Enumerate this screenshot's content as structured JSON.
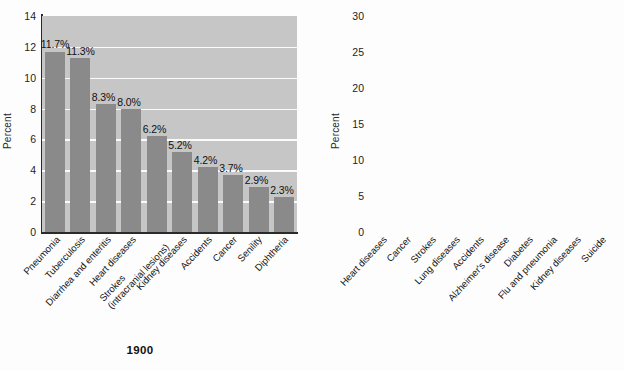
{
  "page": {
    "background": "#fdfdfd",
    "title_remnant": "g"
  },
  "charts": [
    {
      "id": "1900",
      "caption": "1900",
      "ylabel": "Percent",
      "bar_color": "#8a8a8a",
      "plot_background": "#c6c6c6",
      "grid_color": "#fbfbfb",
      "yticks": [
        "14",
        "12",
        "10",
        "8",
        "6",
        "4",
        "2",
        "0"
      ],
      "categories": [
        "Pneumonia",
        "Tuberculosis",
        "Diarrhea and enteritis",
        "Heart diseases",
        "Strokes (intracranial lesions)",
        "Kidney diseases",
        "Accidents",
        "Cancer",
        "Senility",
        "Diphtheria"
      ],
      "category_lines": [
        [
          "Pneumonia"
        ],
        [
          "Tuberculosis"
        ],
        [
          "Diarrhea and enteritis"
        ],
        [
          "Heart diseases"
        ],
        [
          "Strokes",
          "(intracranial lesions)"
        ],
        [
          "Kidney diseases"
        ],
        [
          "Accidents"
        ],
        [
          "Cancer"
        ],
        [
          "Senility"
        ],
        [
          "Diphtheria"
        ]
      ],
      "values": [
        11.7,
        11.3,
        8.3,
        8.0,
        6.2,
        5.2,
        4.2,
        3.7,
        2.9,
        2.3
      ],
      "value_labels": [
        "11.7%",
        "11.3%",
        "8.3%",
        "8.0%",
        "6.2%",
        "5.2%",
        "4.2%",
        "3.7%",
        "2.9%",
        "2.3%"
      ]
    },
    {
      "id": "now",
      "caption": "NOW",
      "ylabel": "Percent",
      "bar_color": "#161616",
      "plot_background": "#d2d2d2",
      "grid_color": "#fbfbfb",
      "yticks": [
        "30",
        "25",
        "20",
        "15",
        "10",
        "5",
        "0"
      ],
      "categories": [
        "Heart diseases",
        "Cancer",
        "Strokes",
        "Lung diseases",
        "Accidents",
        "Alzheimer's disease",
        "Diabetes",
        "Flu and pneumonia",
        "Kidney diseases",
        "Suicide"
      ],
      "category_lines": [
        [
          "Heart diseases"
        ],
        [
          "Cancer"
        ],
        [
          "Strokes"
        ],
        [
          "Lung diseases"
        ],
        [
          "Accidents"
        ],
        [
          "Alzheimer's disease"
        ],
        [
          "Diabetes"
        ],
        [
          "Flu and pneumonia"
        ],
        [
          "Kidney diseases"
        ],
        [
          "Suicide"
        ]
      ],
      "values": [
        25.0,
        22.9,
        5.7,
        5.4,
        4.9,
        3.3,
        2.9,
        2.3,
        2.0,
        1.5
      ],
      "value_labels": [
        "25%",
        "22.9%",
        "5.7%",
        "5.4%",
        "4.9%",
        "3.3%",
        "2.9%",
        "2.3%",
        "2.0%",
        "1.5%"
      ]
    }
  ],
  "chart_data": [
    {
      "type": "bar",
      "title": "1900",
      "xlabel": "",
      "ylabel": "Percent",
      "ylim": [
        0,
        14
      ],
      "ytick_step": 2,
      "grid": true,
      "legend": "none",
      "bar_color": "#8a8a8a",
      "categories": [
        "Pneumonia",
        "Tuberculosis",
        "Diarrhea and enteritis",
        "Heart diseases",
        "Strokes (intracranial lesions)",
        "Kidney diseases",
        "Accidents",
        "Cancer",
        "Senility",
        "Diphtheria"
      ],
      "values": [
        11.7,
        11.3,
        8.3,
        8.0,
        6.2,
        5.2,
        4.2,
        3.7,
        2.9,
        2.3
      ],
      "data_labels": [
        "11.7%",
        "11.3%",
        "8.3%",
        "8.0%",
        "6.2%",
        "5.2%",
        "4.2%",
        "3.7%",
        "2.9%",
        "2.3%"
      ]
    },
    {
      "type": "bar",
      "title": "NOW",
      "xlabel": "",
      "ylabel": "Percent",
      "ylim": [
        0,
        30
      ],
      "ytick_step": 5,
      "grid": true,
      "legend": "none",
      "bar_color": "#161616",
      "categories": [
        "Heart diseases",
        "Cancer",
        "Strokes",
        "Lung diseases",
        "Accidents",
        "Alzheimer's disease",
        "Diabetes",
        "Flu and pneumonia",
        "Kidney diseases",
        "Suicide"
      ],
      "values": [
        25.0,
        22.9,
        5.7,
        5.4,
        4.9,
        3.3,
        2.9,
        2.3,
        2.0,
        1.5
      ],
      "data_labels": [
        "25%",
        "22.9%",
        "5.7%",
        "5.4%",
        "4.9%",
        "3.3%",
        "2.9%",
        "2.3%",
        "2.0%",
        "1.5%"
      ]
    }
  ]
}
